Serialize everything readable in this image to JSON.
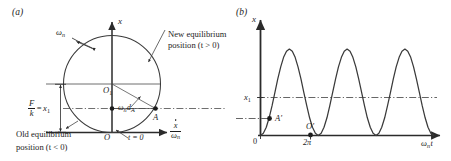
{
  "figure": {
    "width": 451,
    "height": 161,
    "background": "#ffffff",
    "ink_color": "#2b2b2b",
    "curve_color": "#3a3a3a"
  },
  "panel_a": {
    "tag": "(a)",
    "axis_vertical_label": "x",
    "axis_horizontal_label_numerator": "x",
    "axis_horizontal_label_denominator": "ω",
    "axis_horizontal_label_den_sub": "n",
    "omega_label": "ω",
    "omega_label_sub": "n",
    "center_point_label": "O",
    "center_point_sub": "1",
    "origin_point_label": "O",
    "point_a_label": "A",
    "time_zero_label": "t = 0",
    "vector_label_omega": "ω",
    "vector_label_omega_sub": "n",
    "vector_label_d": "d",
    "vector_label_d_sub": "A",
    "amplitude_label_num": "F",
    "amplitude_label_den": "k",
    "amplitude_label_eq": "=",
    "amplitude_label_value": "x",
    "amplitude_label_value_sub": "1",
    "note_new_line1": "New equilibrium",
    "note_new_line2": "position (t > 0)",
    "note_old_line1": "Old equilibrium",
    "note_old_line2": "position (t < 0)"
  },
  "panel_b": {
    "tag": "(b)",
    "axis_vertical_label": "x",
    "axis_horizontal_label": "ω",
    "axis_horizontal_label_sub": "n",
    "axis_horizontal_label_tail": "t",
    "origin_tick_label": "0",
    "x1_tick_label": "x",
    "x1_tick_sub": "1",
    "two_pi_tick_label": "2π",
    "point_a_prime_label": "A′",
    "point_o_prime_label": "O′"
  },
  "chart_data": {
    "type": "line",
    "title": "",
    "xlabel": "ωₙt",
    "ylabel": "x",
    "xlim": [
      0,
      19.2
    ],
    "ylim": [
      0,
      2.35
    ],
    "grid": false,
    "legend_position": "none",
    "x_ticks": [
      {
        "value": 0,
        "label": "0"
      },
      {
        "value": 6.2832,
        "label": "2π"
      }
    ],
    "y_ticks": [
      {
        "value": 1.0,
        "label": "x₁"
      }
    ],
    "reference_lines": [
      {
        "axis": "y",
        "value": 1.0,
        "label": "x₁",
        "style": "dash-dot"
      },
      {
        "axis": "y",
        "value": 0.42,
        "label": "A′ level",
        "style": "dash-dot"
      }
    ],
    "annotations": [
      {
        "label": "A′",
        "x": 0.95,
        "y": 0.42
      },
      {
        "label": "O′",
        "x": 6.2832,
        "y": 0.0
      }
    ],
    "series": [
      {
        "name": "x(t) = x₁(1 − cos ωₙt)",
        "amplitude": 1.0,
        "offset": 1.0,
        "period": 6.2832,
        "x": [
          0.0,
          0.31,
          0.63,
          0.94,
          1.26,
          1.57,
          1.88,
          2.2,
          2.51,
          2.83,
          3.14,
          3.46,
          3.77,
          4.08,
          4.4,
          4.71,
          5.03,
          5.34,
          5.65,
          5.97,
          6.28,
          6.6,
          6.91,
          7.23,
          7.54,
          7.85,
          8.17,
          8.48,
          8.8,
          9.11,
          9.42,
          9.74,
          10.05,
          10.37,
          10.68,
          11.0,
          11.31,
          11.62,
          11.94,
          12.25,
          12.57,
          12.88,
          13.19,
          13.51,
          13.82,
          14.14,
          14.45,
          14.76,
          15.08,
          15.39,
          15.71,
          16.02,
          16.34,
          16.65,
          16.96,
          17.28,
          17.59,
          17.91,
          18.22,
          18.53,
          18.85
        ],
        "y": [
          0.0,
          0.05,
          0.19,
          0.41,
          0.69,
          1.0,
          1.31,
          1.59,
          1.81,
          1.95,
          2.0,
          1.95,
          1.81,
          1.59,
          1.31,
          1.0,
          0.69,
          0.41,
          0.19,
          0.05,
          0.0,
          0.05,
          0.19,
          0.41,
          0.69,
          1.0,
          1.31,
          1.59,
          1.81,
          1.95,
          2.0,
          1.95,
          1.81,
          1.59,
          1.31,
          1.0,
          0.69,
          0.41,
          0.19,
          0.05,
          0.0,
          0.05,
          0.19,
          0.41,
          0.69,
          1.0,
          1.31,
          1.59,
          1.81,
          1.95,
          2.0,
          1.95,
          1.81,
          1.59,
          1.31,
          1.0,
          0.69,
          0.41,
          0.19,
          0.05,
          0.0
        ]
      }
    ]
  }
}
